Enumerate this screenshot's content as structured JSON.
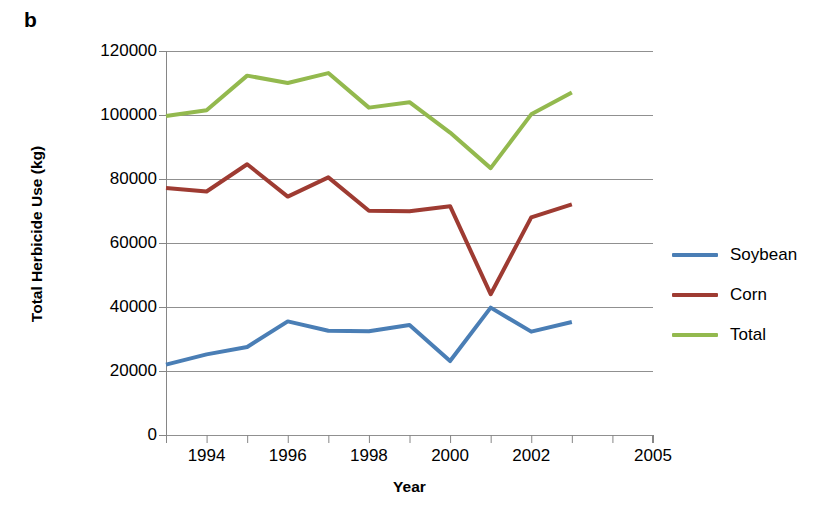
{
  "panel": {
    "label": "b"
  },
  "chart_data": {
    "type": "line",
    "title": "",
    "xlabel": "Year",
    "ylabel": "Total Herbicide Use (kg)",
    "xlim": [
      1993,
      2005
    ],
    "ylim": [
      0,
      120000
    ],
    "grid": "horizontal",
    "legend_position": "right",
    "x_tick_labels": [
      "1994",
      "1996",
      "1998",
      "2000",
      "2002",
      "2005"
    ],
    "x_tick_values": [
      1994,
      1996,
      1998,
      2000,
      2002,
      2005
    ],
    "x_minor_ticks": [
      1993,
      1995,
      1997,
      1999,
      2001,
      2003,
      2004
    ],
    "y_tick_labels": [
      "0",
      "20000",
      "40000",
      "60000",
      "80000",
      "100000",
      "120000"
    ],
    "y_tick_values": [
      0,
      20000,
      40000,
      60000,
      80000,
      100000,
      120000
    ],
    "x": [
      1993,
      1994,
      1995,
      1996,
      1997,
      1998,
      1999,
      2000,
      2001,
      2002,
      2003
    ],
    "series": [
      {
        "name": "Soybean",
        "color": "#4A7EB5",
        "values": [
          22000,
          25200,
          27500,
          35500,
          32600,
          32400,
          34400,
          23100,
          39800,
          32300,
          35300
        ]
      },
      {
        "name": "Corn",
        "color": "#9E3B32",
        "values": [
          77200,
          76100,
          84600,
          74500,
          80500,
          70100,
          69900,
          71500,
          44000,
          68000,
          72100
        ]
      },
      {
        "name": "Total",
        "color": "#93B94E",
        "values": [
          99700,
          101500,
          112300,
          110000,
          113100,
          102300,
          104000,
          94500,
          83400,
          100200,
          107000
        ]
      }
    ]
  },
  "legend": {
    "items": [
      {
        "label": "Soybean",
        "color": "#4A7EB5"
      },
      {
        "label": "Corn",
        "color": "#9E3B32"
      },
      {
        "label": "Total",
        "color": "#93B94E"
      }
    ]
  },
  "style": {
    "axis_color": "#868686",
    "grid_color": "#909090",
    "text_color": "#000000"
  }
}
